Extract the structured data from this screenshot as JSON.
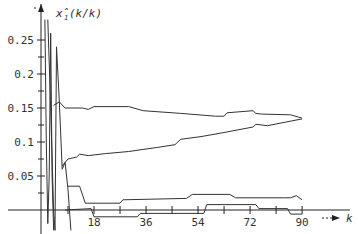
{
  "chart_data": {
    "type": "line",
    "title": "",
    "xlabel": "k",
    "ylabel": "x̂_1(k/k)",
    "x_ticks": [
      18,
      36,
      54,
      72,
      90
    ],
    "y_ticks": [
      0.05,
      0.1,
      0.15,
      0.2,
      0.25
    ],
    "y_tick_labels": [
      "0.05",
      "0.1",
      "0.15",
      "0.2",
      "0.25"
    ],
    "x_tick_labels": [
      "18",
      "36",
      "54",
      "72",
      "90"
    ],
    "xlim": [
      0,
      105
    ],
    "ylim": [
      -0.01,
      0.28
    ],
    "grid": false,
    "legend": null,
    "series": [
      {
        "name": "upper-estimate",
        "x": [
          4,
          6,
          8,
          14,
          16,
          18,
          30,
          35,
          48,
          60,
          63,
          64,
          73,
          74,
          76,
          86,
          90
        ],
        "values": [
          0.154,
          0.159,
          0.15,
          0.15,
          0.148,
          0.152,
          0.152,
          0.146,
          0.142,
          0.138,
          0.138,
          0.143,
          0.146,
          0.142,
          0.141,
          0.14,
          0.135
        ]
      },
      {
        "name": "lower-estimate",
        "x": [
          7,
          9,
          12,
          13,
          16,
          22,
          30,
          40,
          46,
          48,
          55,
          63,
          73,
          74,
          78,
          90
        ],
        "values": [
          0.065,
          0.075,
          0.078,
          0.082,
          0.08,
          0.083,
          0.086,
          0.092,
          0.096,
          0.104,
          0.108,
          0.114,
          0.122,
          0.126,
          0.124,
          0.134
        ]
      },
      {
        "name": "bottom-series-1",
        "x": [
          9,
          13,
          15,
          27,
          28,
          50,
          52,
          65,
          67,
          84,
          86,
          88,
          90
        ],
        "values": [
          0.035,
          0.035,
          0.01,
          0.01,
          0.015,
          0.017,
          0.023,
          0.023,
          0.018,
          0.018,
          0.018,
          0.021,
          0.015
        ]
      },
      {
        "name": "bottom-series-2",
        "x": [
          8,
          17,
          18,
          33,
          34,
          56,
          57,
          74,
          75,
          85,
          86,
          90
        ],
        "values": [
          0.0,
          0.002,
          -0.01,
          -0.01,
          -0.005,
          -0.005,
          0.008,
          0.008,
          0.002,
          0.002,
          -0.006,
          -0.006
        ]
      },
      {
        "name": "initial-transient-1",
        "x": [
          1,
          1.5,
          2,
          2.5,
          3,
          3.5,
          4
        ],
        "values": [
          0.28,
          0.1,
          -0.02,
          0.05,
          0.26,
          0.05,
          -0.03
        ]
      },
      {
        "name": "initial-transient-2",
        "x": [
          2,
          3,
          4,
          4.5,
          5,
          6,
          7,
          8,
          9,
          10
        ],
        "values": [
          0.28,
          0.15,
          0.0,
          -0.03,
          0.24,
          0.16,
          0.06,
          0.07,
          0.03,
          -0.03
        ]
      }
    ]
  },
  "axes": {
    "y_label_text": "x̂",
    "y_label_sub": "1",
    "y_label_tail": "(k/k)",
    "x_label_text": "k"
  }
}
